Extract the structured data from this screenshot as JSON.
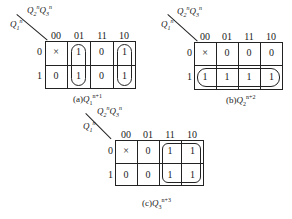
{
  "maps": [
    {
      "id": "a",
      "row_var": "Q1n",
      "col_var": "Q2nQ3n",
      "col_headers": [
        "00",
        "01",
        "11",
        "10"
      ],
      "row_headers": [
        "0",
        "1"
      ],
      "cells": [
        [
          "×",
          "1",
          "0",
          "1"
        ],
        [
          "0",
          "1",
          "0",
          "1"
        ]
      ],
      "caption_label": "(a)",
      "caption_var": "Q",
      "caption_sub": "1",
      "caption_sup": "n+1"
    },
    {
      "id": "b",
      "row_var": "Q1n",
      "col_var": "Q2nQ3n",
      "col_headers": [
        "00",
        "01",
        "11",
        "10"
      ],
      "row_headers": [
        "0",
        "1"
      ],
      "cells": [
        [
          "×",
          "0",
          "0",
          "0"
        ],
        [
          "1",
          "1",
          "1",
          "1"
        ]
      ],
      "caption_label": "(b)",
      "caption_var": "Q",
      "caption_sub": "2",
      "caption_sup": "n+2"
    },
    {
      "id": "c",
      "row_var": "Q1n",
      "col_var": "Q2nQ3n",
      "col_headers": [
        "00",
        "01",
        "11",
        "10"
      ],
      "row_headers": [
        "0",
        "1"
      ],
      "cells": [
        [
          "×",
          "0",
          "1",
          "1"
        ],
        [
          "0",
          "0",
          "1",
          "1"
        ]
      ],
      "caption_label": "(c)",
      "caption_var": "Q",
      "caption_sub": "3",
      "caption_sup": "n+3"
    }
  ],
  "labels": {
    "q": "Q",
    "n": "n",
    "s1": "1",
    "s2": "2",
    "s3": "3"
  }
}
